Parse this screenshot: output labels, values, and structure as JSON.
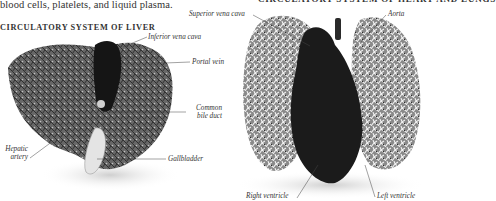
{
  "intro_text": "blood cells, platelets, and liquid plasma.",
  "right_heading_partial": "CIRCULATORY SYSTEM OF HEART AND LUNGS",
  "liver_section": {
    "heading": "CIRCULATORY SYSTEM OF LIVER",
    "labels": {
      "inferior_vena_cava": "Inferior vena cava",
      "portal_vein": "Portal vein",
      "common_bile_duct_1": "Common",
      "common_bile_duct_2": "bile duct",
      "hepatic_artery_1": "Hepatic",
      "hepatic_artery_2": "artery",
      "gallbladder": "Gallbladder"
    }
  },
  "heart_section": {
    "labels": {
      "superior_vena_cava": "Superior vena cava",
      "aorta": "Aorta",
      "right_ventricle": "Right ventricle",
      "left_ventricle": "Left ventricle"
    }
  }
}
